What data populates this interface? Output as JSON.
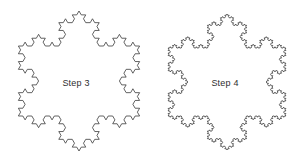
{
  "canvas": {
    "width": 300,
    "height": 162,
    "background_color": "#ffffff",
    "stroke_color": "#3a3a3a",
    "stroke_width": 0.8,
    "text_color": "#2e2e2e"
  },
  "figures": [
    {
      "id": "step3",
      "caption": "Step 3",
      "shape": "koch-snowflake",
      "iterations": 3,
      "center_x": 79,
      "center_y": 81,
      "circumradius": 70,
      "rotation_degrees": -90,
      "bounds": {
        "left": 14,
        "right": 144,
        "top": 11,
        "bottom": 151
      }
    },
    {
      "id": "step4",
      "caption": "Step 4",
      "shape": "koch-snowflake",
      "iterations": 4,
      "center_x": 227,
      "center_y": 82,
      "circumradius": 68,
      "rotation_degrees": -90,
      "bounds": {
        "left": 164,
        "right": 290,
        "top": 14,
        "bottom": 150
      }
    }
  ]
}
